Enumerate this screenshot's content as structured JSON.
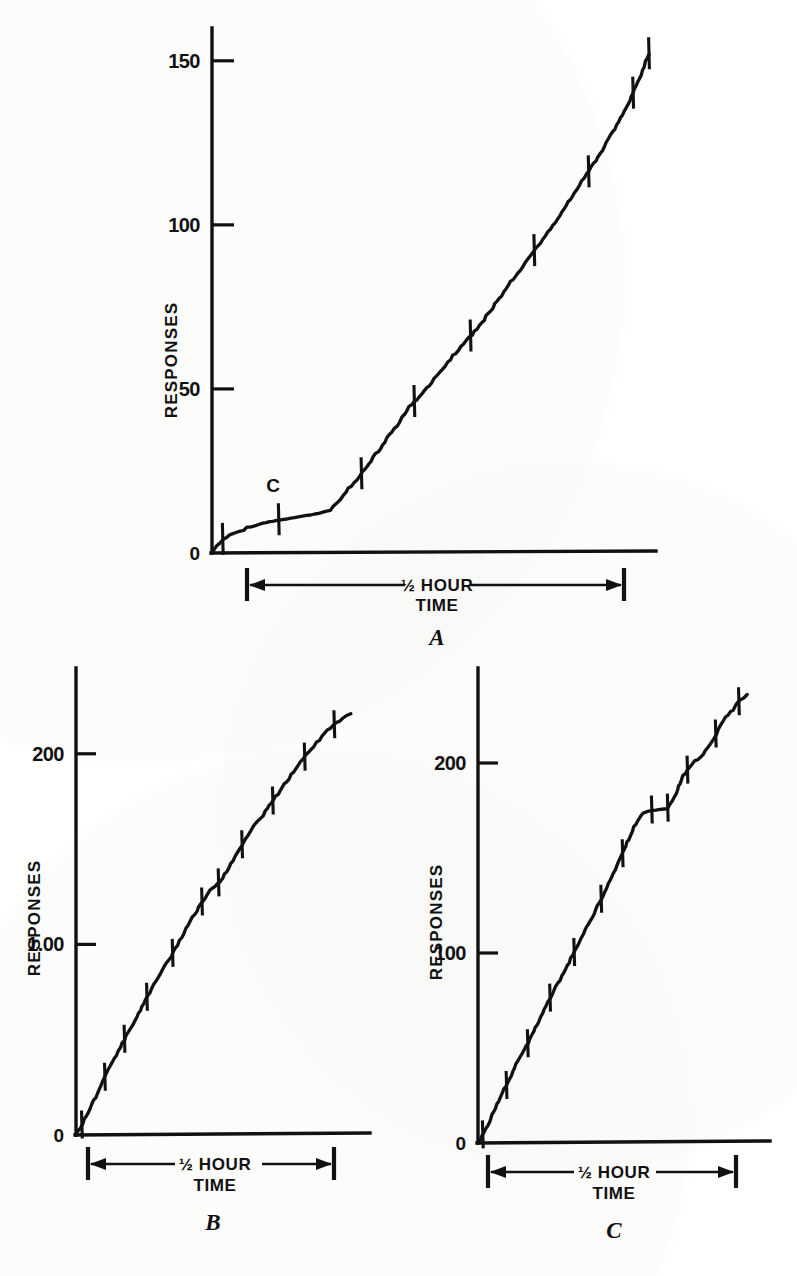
{
  "figure": {
    "kind": "cumulative-response-records",
    "panel_count": 3,
    "ink_color": "#111111",
    "paper_color": "#fffffe",
    "clipped_caption_fragment": "of the effect of the added stimulus on the rate"
  },
  "labels": {
    "y_axis_title": "RESPONSES",
    "scale_line1": "½ HOUR",
    "scale_line2": "TIME",
    "c_marker": "C",
    "zero": "0"
  },
  "chart_data": [
    {
      "id": "A",
      "type": "line",
      "title": "A",
      "panel_letter": "A",
      "xlabel": "TIME",
      "ylabel": "RESPONSES",
      "x_scale_caption": "½ HOUR",
      "ytick_labels": [
        "0",
        "50",
        "100",
        "150"
      ],
      "yticks": [
        0,
        50,
        100,
        150
      ],
      "ylim": [
        0,
        160
      ],
      "xlim": [
        0,
        36
      ],
      "grid": false,
      "legend": "none",
      "annotations": [
        {
          "text": "C",
          "x": 9.6,
          "y": 13,
          "note": "onset of added stimulus C"
        }
      ],
      "reinforcement_pips_y": [
        4,
        10,
        24,
        46,
        66,
        92,
        116,
        140,
        152
      ],
      "x": [
        0.0,
        0.4,
        0.9,
        1.4,
        2.0,
        2.8,
        3.6,
        4.4,
        5.2,
        6.1,
        7.0,
        8.0,
        9.0,
        9.6,
        10.4,
        11.3,
        12.2,
        13.1,
        14.0,
        15.0,
        16.0,
        17.0,
        18.0,
        19.1,
        20.2,
        21.3,
        22.4,
        23.5,
        24.6,
        25.8,
        27.0,
        28.2,
        29.4,
        30.6,
        31.8,
        33.0,
        34.0,
        34.8,
        35.4
      ],
      "y": [
        0.0,
        2.5,
        4.2,
        5.4,
        6.3,
        7.6,
        8.5,
        9.3,
        9.9,
        10.4,
        11.0,
        11.6,
        12.4,
        13.0,
        16.5,
        20.5,
        24.5,
        29.0,
        34.0,
        39.0,
        44.5,
        48.5,
        53.0,
        58.0,
        63.0,
        67.5,
        73.0,
        78.5,
        84.5,
        90.5,
        96.5,
        103.0,
        110.0,
        116.5,
        124.0,
        131.5,
        139.0,
        146.0,
        152.0
      ],
      "description": "Cumulative record: slow initial rate, then a sustained steady high rate after point C."
    },
    {
      "id": "B",
      "type": "line",
      "title": "B",
      "panel_letter": "B",
      "xlabel": "TIME",
      "ylabel": "RESPONSES",
      "x_scale_caption": "½ HOUR",
      "ytick_labels": [
        "0",
        "1.00",
        "200"
      ],
      "yticks": [
        0,
        100,
        200
      ],
      "ylim": [
        0,
        245
      ],
      "xlim": [
        0,
        33
      ],
      "grid": false,
      "legend": "none",
      "annotations": [],
      "reinforcement_pips_y": [
        5,
        30,
        50,
        72,
        95,
        122,
        132,
        152,
        175,
        198,
        215
      ],
      "x": [
        0.0,
        0.5,
        1.2,
        2.2,
        3.2,
        4.3,
        5.4,
        6.6,
        7.8,
        9.0,
        10.2,
        11.4,
        12.6,
        13.8,
        15.0,
        16.2,
        17.4,
        18.6,
        19.8,
        21.0,
        22.2,
        23.4,
        24.6,
        25.8,
        27.0,
        28.2,
        29.2,
        30.0,
        30.8
      ],
      "y": [
        0.0,
        4.0,
        10.0,
        20.0,
        30.0,
        40.0,
        50.0,
        60.0,
        71.0,
        81.0,
        90.0,
        100.0,
        110.0,
        120.0,
        128.0,
        133.0,
        142.0,
        152.0,
        161.0,
        168.0,
        176.0,
        184.0,
        192.0,
        199.0,
        206.0,
        212.0,
        216.0,
        219.0,
        221.0
      ],
      "description": "Cumulative record with an essentially constant high rate throughout the half hour."
    },
    {
      "id": "C",
      "type": "line",
      "title": "C",
      "panel_letter": "C",
      "xlabel": "TIME",
      "ylabel": "RESPONSES",
      "x_scale_caption": "½ HOUR",
      "ytick_labels": [
        "0",
        "100",
        "200"
      ],
      "yticks": [
        0,
        100,
        200
      ],
      "ylim": [
        0,
        250
      ],
      "xlim": [
        0,
        33
      ],
      "grid": false,
      "legend": "none",
      "annotations": [
        {
          "text": "plateau",
          "x": 19.5,
          "y": 175,
          "note": "pause in responding, rate falls to zero"
        }
      ],
      "reinforcement_pips_y": [
        4,
        30,
        52,
        76,
        100,
        128,
        152,
        175,
        176,
        196,
        215,
        232
      ],
      "x": [
        0.0,
        0.5,
        1.3,
        2.3,
        3.4,
        4.5,
        5.7,
        6.9,
        8.1,
        9.3,
        10.5,
        11.7,
        12.9,
        14.1,
        15.3,
        16.5,
        17.6,
        18.6,
        19.6,
        20.6,
        21.4,
        22.2,
        23.2,
        24.2,
        25.2,
        26.2,
        27.2,
        28.0,
        28.8,
        29.6,
        30.4
      ],
      "y": [
        0.0,
        4.0,
        11.0,
        22.0,
        32.0,
        43.0,
        53.0,
        64.0,
        76.0,
        86.0,
        97.0,
        108.0,
        119.0,
        130.0,
        142.0,
        154.0,
        166.0,
        174.0,
        175.0,
        175.5,
        176.0,
        182.0,
        193.0,
        200.0,
        203.0,
        210.0,
        218.0,
        224.0,
        228.0,
        233.0,
        236.0
      ],
      "description": "Cumulative record showing a marked pause (flat segment) near 175 responses, then recovery of the previous rate."
    }
  ]
}
